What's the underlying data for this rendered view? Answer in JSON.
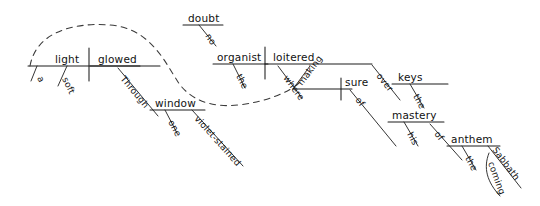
{
  "diagram": {
    "kind": "reed-kellogg-sentence-diagram",
    "sentence": "A soft light glowed through one violet-stained window; no doubt the organist loitered where, making sure of his mastery of the coming Sabbath anthem, over the keys.",
    "ink_color": "#111111",
    "background_color": "#ffffff",
    "clause_one": {
      "subject": "light",
      "verb": "glowed",
      "subject_modifiers": [
        "a",
        "soft"
      ],
      "preposition": "Through",
      "object_of_preposition": "window",
      "object_modifiers": [
        "one",
        "violet-stained"
      ]
    },
    "interjection": {
      "head": "doubt",
      "modifier": "no"
    },
    "clause_two": {
      "subject": "organist",
      "subject_modifier": "the",
      "verb": "loitered",
      "adverb": "where",
      "participle": "making",
      "participle_object": "sure",
      "preposition_one": "over",
      "object_one": "keys",
      "object_one_modifier": "the",
      "preposition_two": "of",
      "object_two": "mastery",
      "object_two_modifier": "his",
      "preposition_three": "of",
      "object_three": "anthem",
      "object_three_modifier": "the",
      "possessive": "Sabbath",
      "possessive_modifier": "coming"
    },
    "labels": {
      "a": "a",
      "soft": "soft",
      "light": "light",
      "glowed": "glowed",
      "through": "Through",
      "window": "window",
      "one": "one",
      "violet_stained": "violet-stained",
      "no": "no",
      "doubt": "doubt",
      "the_organist": "the",
      "organist": "organist",
      "loitered": "loitered",
      "where": "where",
      "making": "making",
      "sure": "sure",
      "over": "over",
      "keys": "keys",
      "the_keys": "the",
      "of_one": "of",
      "mastery": "mastery",
      "his": "his",
      "of_two": "of",
      "anthem": "anthem",
      "the_anthem": "the",
      "sabbath": "Sabbath",
      "coming": "coming"
    }
  }
}
